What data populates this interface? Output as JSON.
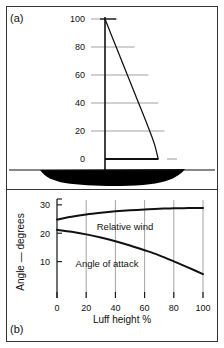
{
  "figure": {
    "panel_a_tag": "(a)",
    "panel_b_tag": "(b)",
    "background_color": "#ffffff",
    "ink_color": "#111111",
    "grid_color": "#8c8c8c",
    "frame_color": "#333333"
  },
  "chart_data": [
    {
      "id": "panel-a",
      "type": "line",
      "title": "",
      "subtitle": "",
      "xlabel": "",
      "ylabel": "",
      "grid": true,
      "legend": "none",
      "annotations": [
        "(a)"
      ],
      "description": "Sail plan profile: mast (vertical luff) with leech curve and boom, drawn over a boat hull silhouette. Horizontal gridlines mark luff height percentage.",
      "y_ticks": [
        0,
        20,
        40,
        60,
        80,
        100
      ],
      "y_tick_labels": [
        "0",
        "20",
        "40",
        "60",
        "80",
        "100"
      ],
      "ylim": [
        0,
        100
      ],
      "xlim": [
        0,
        100
      ],
      "series": [
        {
          "name": "luff (mast)",
          "x": [
            0,
            0
          ],
          "y": [
            0,
            100
          ]
        },
        {
          "name": "leech",
          "x": [
            0,
            18,
            38,
            58,
            76,
            88,
            95
          ],
          "y": [
            100,
            82,
            62,
            42,
            24,
            11,
            0
          ]
        },
        {
          "name": "foot (boom)",
          "x": [
            0,
            95
          ],
          "y": [
            0,
            0
          ]
        }
      ],
      "gridline_extents": [
        {
          "y": 100,
          "x_end": 20
        },
        {
          "y": 80,
          "x_end": 48
        },
        {
          "y": 60,
          "x_end": 70
        },
        {
          "y": 40,
          "x_end": 86
        },
        {
          "y": 20,
          "x_end": 96
        },
        {
          "y": 0,
          "x_end": 112
        }
      ]
    },
    {
      "id": "panel-b",
      "type": "line",
      "title": "",
      "subtitle": "",
      "xlabel": "Luff height %",
      "ylabel": "Angle — degrees",
      "grid": true,
      "legend": "inline-labels",
      "annotations": [
        "(b)"
      ],
      "x_ticks": [
        0,
        20,
        40,
        60,
        80,
        100
      ],
      "x_tick_labels": [
        "0",
        "20",
        "40",
        "60",
        "80",
        "100"
      ],
      "y_ticks": [
        10,
        20,
        30
      ],
      "y_tick_labels": [
        "10",
        "20",
        "30"
      ],
      "xlim": [
        0,
        100
      ],
      "ylim": [
        0,
        31
      ],
      "series": [
        {
          "name": "Relative wind",
          "label": "Relative wind",
          "x": [
            0,
            10,
            20,
            30,
            40,
            50,
            60,
            70,
            80,
            90,
            100
          ],
          "y": [
            24.8,
            25.8,
            26.6,
            27.2,
            27.7,
            28.1,
            28.4,
            28.6,
            28.8,
            28.85,
            28.9
          ]
        },
        {
          "name": "Angle of attack",
          "label": "Angle of attack",
          "x": [
            0,
            10,
            20,
            30,
            40,
            50,
            60,
            70,
            80,
            90,
            100
          ],
          "y": [
            21.2,
            20.5,
            19.6,
            18.5,
            17.2,
            15.7,
            14.0,
            12.2,
            10.1,
            7.9,
            5.6
          ]
        }
      ]
    }
  ]
}
